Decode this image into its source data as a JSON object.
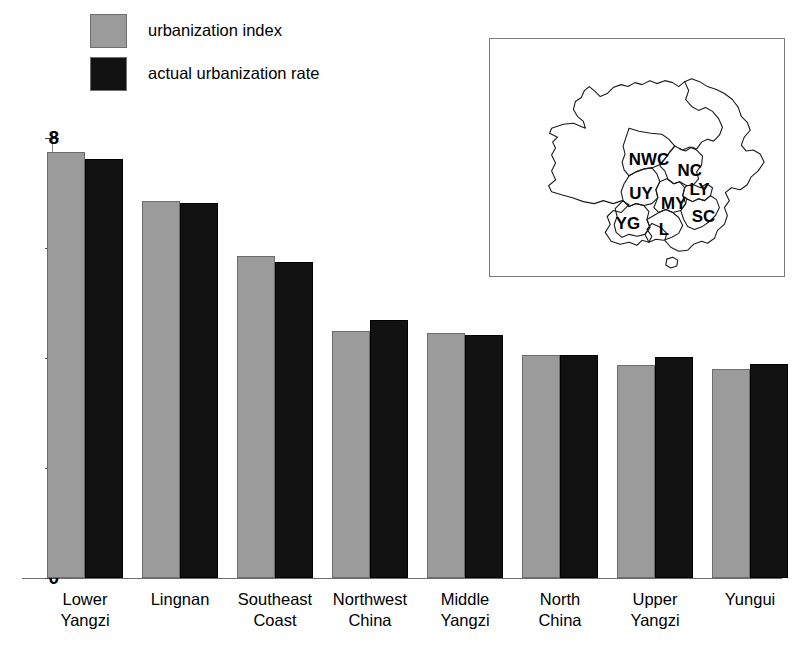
{
  "chart_data": {
    "type": "bar",
    "title": "",
    "subtitle": "",
    "xlabel": "",
    "ylabel": "",
    "ylim": [
      0,
      8
    ],
    "yticks": [
      0,
      2,
      4,
      6,
      8
    ],
    "ytick_labels": [
      "0",
      "2",
      "4",
      "6",
      "8"
    ],
    "grid": false,
    "legend_position": "top-left",
    "categories": [
      "Lower\nYangzi",
      "Lingnan",
      "Southeast\nCoast",
      "Northwest\nChina",
      "Middle\nYangzi",
      "North\nChina",
      "Upper\nYangzi",
      "Yungui"
    ],
    "series": [
      {
        "name": "urbanization index",
        "color": "#9b9b9b",
        "values": [
          7.75,
          6.85,
          5.85,
          4.5,
          4.45,
          4.05,
          3.88,
          3.8
        ]
      },
      {
        "name": "actual urbanization rate",
        "color": "#121212",
        "values": [
          7.62,
          6.82,
          5.75,
          4.7,
          4.42,
          4.05,
          4.02,
          3.9
        ]
      }
    ]
  },
  "legend": {
    "items": [
      {
        "label": "urbanization index",
        "color": "#9b9b9b"
      },
      {
        "label": "actual urbanization rate",
        "color": "#121212"
      }
    ]
  },
  "inset_map": {
    "name": "china-macroregions-map",
    "regions": [
      {
        "code": "NWC",
        "x": 160,
        "y": 123
      },
      {
        "code": "NC",
        "x": 201,
        "y": 134
      },
      {
        "code": "UY",
        "x": 152,
        "y": 157
      },
      {
        "code": "LY",
        "x": 211,
        "y": 153
      },
      {
        "code": "MY",
        "x": 185,
        "y": 167
      },
      {
        "code": "SC",
        "x": 215,
        "y": 180
      },
      {
        "code": "YG",
        "x": 139,
        "y": 187
      },
      {
        "code": "L",
        "x": 175,
        "y": 193
      }
    ]
  }
}
